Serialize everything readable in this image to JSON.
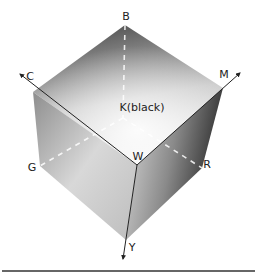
{
  "diagram": {
    "vertices": {
      "B": "B",
      "C": "C",
      "M": "M",
      "W": "W",
      "G": "G",
      "R": "R",
      "Y": "Y",
      "K": "K(black)"
    },
    "axes": [
      "C",
      "M",
      "Y"
    ],
    "colors": {
      "edge": "#222222",
      "dashed": "#ffffff",
      "top_light": "#f2f2f2",
      "top_dark": "#5a5a5a",
      "left_light": "#e6e6e6",
      "left_dark": "#9a9a9a",
      "right_light": "#c8c8c8",
      "right_dark": "#3a3a3a",
      "rule": "#333333"
    }
  }
}
